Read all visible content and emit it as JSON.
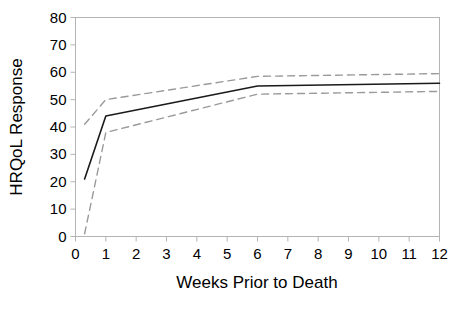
{
  "chart_data": {
    "type": "line",
    "title": "",
    "subtitle": "",
    "xlabel": "Weeks Prior to Death",
    "ylabel": "HRQoL Response",
    "xlim": [
      0,
      12
    ],
    "ylim": [
      0,
      80
    ],
    "xticks": [
      0,
      1,
      2,
      3,
      4,
      5,
      6,
      7,
      8,
      9,
      10,
      11,
      12
    ],
    "yticks": [
      0,
      10,
      20,
      30,
      40,
      50,
      60,
      70,
      80
    ],
    "xtick_labels": [
      "0",
      "1",
      "2",
      "3",
      "4",
      "5",
      "6",
      "7",
      "8",
      "9",
      "10",
      "11",
      "12"
    ],
    "ytick_labels": [
      "0",
      "10",
      "20",
      "30",
      "40",
      "50",
      "60",
      "70",
      "80"
    ],
    "grid": false,
    "legend": null,
    "legend_position": "none",
    "annotations": [],
    "series": [
      {
        "name": "Mean HRQoL Response",
        "style": "solid",
        "color": "#1a1a1a",
        "width": 1.6,
        "x": [
          0.3,
          1.0,
          6.0,
          12.0
        ],
        "values": [
          21,
          44,
          55,
          56
        ]
      },
      {
        "name": "Upper 95% Confidence Limit",
        "style": "dashed",
        "color": "#9a9a9a",
        "width": 1.4,
        "x": [
          0.3,
          1.0,
          6.0,
          12.0
        ],
        "values": [
          41,
          50,
          58.5,
          59.5
        ]
      },
      {
        "name": "Lower 95% Confidence Limit",
        "style": "dashed",
        "color": "#9a9a9a",
        "width": 1.4,
        "x": [
          0.3,
          1.0,
          6.0,
          12.0
        ],
        "values": [
          1,
          38,
          52,
          53
        ]
      }
    ]
  },
  "frame": {
    "border_color": "#b4b4b4",
    "background": "#ffffff"
  }
}
